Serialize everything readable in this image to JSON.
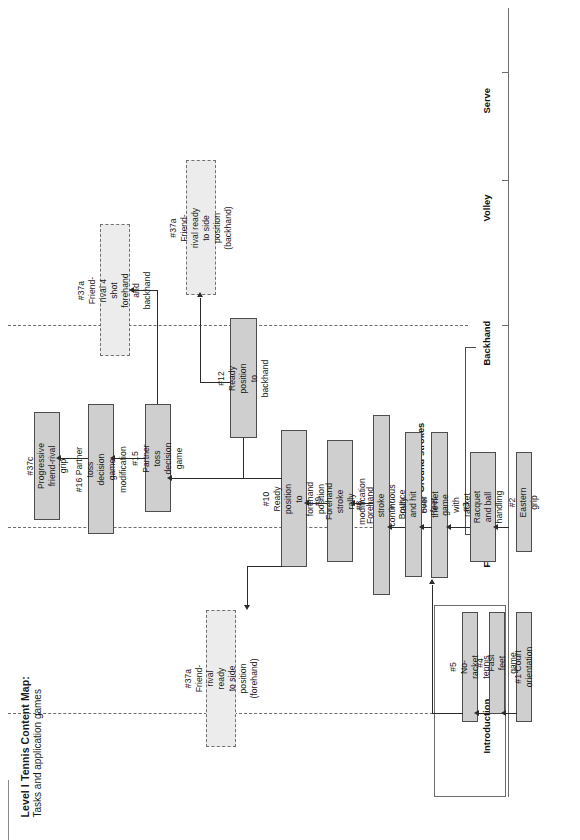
{
  "figure": {
    "title_main": "Level I Tennis Content Map:",
    "title_sub": "Tasks and application games"
  },
  "axis": {
    "orientation": "vertical-right",
    "phase_labels": [
      "Introduction",
      "Forehand",
      "Backhand",
      "Volley",
      "Serve"
    ],
    "group_label": "Ground strokes",
    "group_covers": [
      "Forehand",
      "Backhand"
    ]
  },
  "nodes": [
    {
      "id": "n1",
      "label": "#1 Court orientation",
      "style": "solid"
    },
    {
      "id": "n2",
      "label": "#2 Eastern grip",
      "style": "solid"
    },
    {
      "id": "n3",
      "label": "#3 Racquet and ball\nhandling",
      "style": "solid"
    },
    {
      "id": "n4",
      "label": "#4 Fast feet game",
      "style": "solid"
    },
    {
      "id": "n5",
      "label": "#5 No-racket tennis",
      "style": "solid"
    },
    {
      "id": "n6",
      "label": "#6 Fast feet game with racket",
      "style": "solid"
    },
    {
      "id": "n7",
      "label": "#7 Bounce and hit over the net",
      "style": "solid"
    },
    {
      "id": "n8",
      "label": "#8 Forehand stroke continuous rally",
      "style": "solid"
    },
    {
      "id": "n9",
      "label": "#9 Forehand stroke\nrally modification",
      "style": "solid"
    },
    {
      "id": "n10",
      "label": "#10 Ready position to\nforehand position",
      "style": "solid"
    },
    {
      "id": "n12",
      "label": "#12 Ready position to\nbackhand",
      "style": "solid"
    },
    {
      "id": "n15",
      "label": "#15 Partner toss\ndecision game",
      "style": "solid"
    },
    {
      "id": "n16",
      "label": "#16 Partner toss decision\ngame modification",
      "style": "solid"
    },
    {
      "id": "n37a_fore",
      "label": "#37a Friend-rival ready\nto side position (forehand)",
      "style": "dashed"
    },
    {
      "id": "n37a_back",
      "label": "#37a Friend-rival ready\nto side position (backhand)",
      "style": "dashed"
    },
    {
      "id": "n37a_4shot",
      "label": "#37a Friend-rival 4 shot\nforehand and backhand",
      "style": "dashed"
    },
    {
      "id": "n37c",
      "label": "#37c Progressive\nfriend-rival grip",
      "style": "dashed-solid"
    }
  ],
  "edges": [
    {
      "from": "n1",
      "to": "n4"
    },
    {
      "from": "n4",
      "to": "n5"
    },
    {
      "from": "n5",
      "to": "n6"
    },
    {
      "from": "n2",
      "to": "n3"
    },
    {
      "from": "n3",
      "to": "n6"
    },
    {
      "from": "n6",
      "to": "n7"
    },
    {
      "from": "n7",
      "to": "n8"
    },
    {
      "from": "n8",
      "to": "n9"
    },
    {
      "from": "n9",
      "to": "n10"
    },
    {
      "from": "n10",
      "to": "n37a_fore"
    },
    {
      "from": "n10",
      "to": "n15"
    },
    {
      "from": "n12",
      "to": "n37a_back"
    },
    {
      "from": "n12",
      "to": "n15"
    },
    {
      "from": "n15",
      "to": "n37a_4shot"
    },
    {
      "from": "n15",
      "to": "n16"
    },
    {
      "from": "n16",
      "to": "n37c"
    }
  ],
  "colors": {
    "node_fill_solid": "#cfcfcf",
    "node_fill_dashed": "#ececec",
    "node_border": "#4d4d4d",
    "edge": "#2b2b2b",
    "axis": "#6e6e6e",
    "background": "#ffffff"
  }
}
